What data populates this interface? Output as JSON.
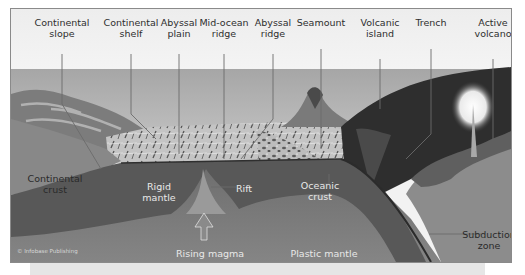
{
  "diagram": {
    "top_labels": [
      {
        "line1": "Continental",
        "line2": "slope"
      },
      {
        "line1": "Continental",
        "line2": "shelf"
      },
      {
        "line1": "Abyssal",
        "line2": "plain"
      },
      {
        "line1": "Mid-ocean",
        "line2": "ridge"
      },
      {
        "line1": "Abyssal",
        "line2": "ridge"
      },
      {
        "line1": "Seamount",
        "line2": ""
      },
      {
        "line1": "Volcanic",
        "line2": "island"
      },
      {
        "line1": "Trench",
        "line2": ""
      },
      {
        "line1": "Active",
        "line2": "volcano"
      }
    ],
    "inner_labels": {
      "continental_crust": {
        "line1": "Continental",
        "line2": "crust"
      },
      "rigid_mantle": {
        "line1": "Rigid",
        "line2": "mantle"
      },
      "rift": "Rift",
      "oceanic_crust": {
        "line1": "Oceanic",
        "line2": "crust"
      },
      "subduction_zone": {
        "line1": "Subduction",
        "line2": "zone"
      },
      "rising_magma": "Rising magma",
      "plastic_mantle": "Plastic mantle"
    },
    "copyright": "© Infobase Publishing",
    "colors": {
      "sky": "#f3f3f3",
      "ocean_surface": "#a9a9a9",
      "seafloor_texture": "#bdbdbd",
      "continental_crust": "#8a8a8a",
      "rigid_mantle": "#5a5a5a",
      "plastic_mantle": "#777777",
      "trench_dark": "#2c2c2c",
      "frame_border": "#8a8a8a"
    }
  }
}
